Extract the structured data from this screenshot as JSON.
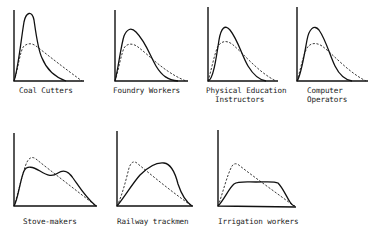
{
  "figure": {
    "panels": [
      {
        "id": "coal-cutters",
        "label": "Coal Cutters",
        "label_lines": [
          "Coal Cutters"
        ]
      },
      {
        "id": "foundry-workers",
        "label": "Foundry Workers",
        "label_lines": [
          "Foundry Workers"
        ]
      },
      {
        "id": "physical-education-instructors",
        "label": "Physical Education Instructors",
        "label_lines": [
          "Physical Education",
          "  Instructors"
        ]
      },
      {
        "id": "computer-operators",
        "label": "Computer Operators",
        "label_lines": [
          "Computer",
          "Operators"
        ]
      },
      {
        "id": "stove-makers",
        "label": "Stove-makers",
        "label_lines": [
          "Stove-makers"
        ]
      },
      {
        "id": "railway-trackmen",
        "label": "Railway trackmen",
        "label_lines": [
          "Railway trackmen"
        ]
      },
      {
        "id": "irrigation-workers",
        "label": "Irrigation workers",
        "label_lines": [
          "Irrigation workers"
        ]
      }
    ],
    "legend_semantics": {
      "solid": "occupational group curve",
      "dashed": "reference curve"
    },
    "colors": {
      "ink": "#111111",
      "background": "#ffffff"
    }
  }
}
